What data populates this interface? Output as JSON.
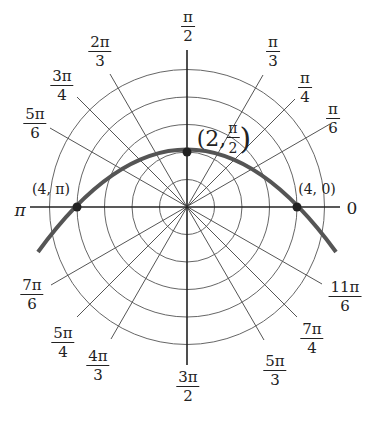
{
  "diagram": {
    "type": "polar_grid_with_curve",
    "center_px": [
      187,
      207
    ],
    "unit_px": 27.5,
    "circles": [
      1,
      2,
      3,
      4,
      5
    ],
    "angle_labels": [
      {
        "id": "0",
        "num": "0",
        "den": "",
        "angle_deg": 0
      },
      {
        "id": "pi_6",
        "num": "π",
        "den": "6",
        "angle_deg": 30
      },
      {
        "id": "pi_4",
        "num": "π",
        "den": "4",
        "angle_deg": 45
      },
      {
        "id": "pi_3",
        "num": "π",
        "den": "3",
        "angle_deg": 60
      },
      {
        "id": "pi_2",
        "num": "π",
        "den": "2",
        "angle_deg": 90
      },
      {
        "id": "2pi_3",
        "num": "2π",
        "den": "3",
        "angle_deg": 120
      },
      {
        "id": "3pi_4",
        "num": "3π",
        "den": "4",
        "angle_deg": 135
      },
      {
        "id": "5pi_6",
        "num": "5π",
        "den": "6",
        "angle_deg": 150
      },
      {
        "id": "pi",
        "num": "π",
        "den": "",
        "angle_deg": 180
      },
      {
        "id": "7pi_6",
        "num": "7π",
        "den": "6",
        "angle_deg": 210
      },
      {
        "id": "5pi_4",
        "num": "5π",
        "den": "4",
        "angle_deg": 225
      },
      {
        "id": "4pi_3",
        "num": "4π",
        "den": "3",
        "angle_deg": 240
      },
      {
        "id": "3pi_2",
        "num": "3π",
        "den": "2",
        "angle_deg": 270
      },
      {
        "id": "5pi_3",
        "num": "5π",
        "den": "3",
        "angle_deg": 300
      },
      {
        "id": "7pi_4",
        "num": "7π",
        "den": "4",
        "angle_deg": 315
      },
      {
        "id": "11pi_6",
        "num": "11π",
        "den": "6",
        "angle_deg": 330
      }
    ],
    "points": [
      {
        "label": "(4, π)",
        "r": 4,
        "theta": "π"
      },
      {
        "label_prefix": "(2, ",
        "label_num": "π",
        "label_den": "2",
        "label_suffix": ")",
        "r": 2,
        "theta": "π/2"
      },
      {
        "label": "(4, 0)",
        "r": 4,
        "theta": "0"
      }
    ],
    "curve": {
      "description": "parabola through (4,0), (2,π/2), (4,π)",
      "stroke": "#555555"
    }
  }
}
